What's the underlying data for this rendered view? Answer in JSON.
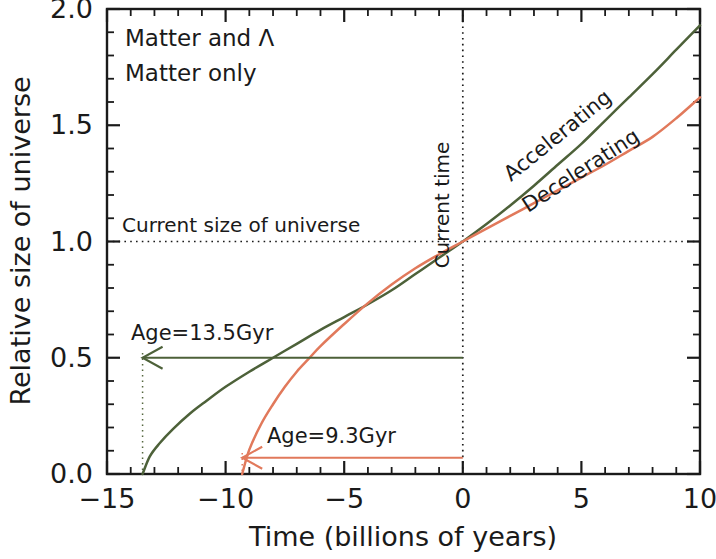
{
  "chart_data": {
    "type": "line",
    "title": "",
    "xlabel": "Time (billions of years)",
    "ylabel": "Relative size of universe",
    "xlim": [
      -15,
      10
    ],
    "ylim": [
      0.0,
      2.0
    ],
    "x_ticks": [
      -15,
      -10,
      -5,
      0,
      5,
      10
    ],
    "x_tick_labels": [
      "-15",
      "-10",
      "-5",
      "0",
      "5",
      "10"
    ],
    "x_minor_step": 1,
    "y_ticks": [
      0.0,
      0.5,
      1.0,
      1.5,
      2.0
    ],
    "y_tick_labels": [
      "0.0",
      "0.5",
      "1.0",
      "1.5",
      "2.0"
    ],
    "y_minor_step": 0.1,
    "grid": false,
    "legend_position": "top-left",
    "series": [
      {
        "name": "Matter and Λ",
        "color": "#4d6139",
        "curve_label": "Accelerating",
        "big_bang_time": -13.5,
        "age_label": "Age=13.5Gyr",
        "x": [
          -13.5,
          -13.2,
          -12.8,
          -12.2,
          -11.5,
          -10.8,
          -10.0,
          -9.0,
          -8.0,
          -7.0,
          -6.0,
          -5.0,
          -4.0,
          -3.0,
          -2.0,
          -1.0,
          0.0,
          1.0,
          2.0,
          3.0,
          4.0,
          5.0,
          6.0,
          7.0,
          8.0,
          9.0,
          10.0
        ],
        "y": [
          0.0,
          0.075,
          0.13,
          0.195,
          0.26,
          0.315,
          0.375,
          0.44,
          0.5,
          0.56,
          0.62,
          0.675,
          0.73,
          0.79,
          0.86,
          0.93,
          1.0,
          1.075,
          1.155,
          1.24,
          1.33,
          1.42,
          1.52,
          1.62,
          1.72,
          1.825,
          1.93
        ]
      },
      {
        "name": "Matter only",
        "color": "#e1795b",
        "curve_label": "Decelerating",
        "big_bang_time": -9.3,
        "age_label": "Age=9.3Gyr",
        "x": [
          -9.3,
          -9.0,
          -8.5,
          -8.0,
          -7.5,
          -7.0,
          -6.5,
          -6.0,
          -5.0,
          -4.0,
          -3.0,
          -2.0,
          -1.0,
          0.0,
          1.0,
          2.0,
          3.0,
          4.0,
          5.0,
          6.0,
          7.0,
          8.0,
          9.0,
          10.0
        ],
        "y": [
          0.0,
          0.105,
          0.215,
          0.3,
          0.375,
          0.44,
          0.495,
          0.55,
          0.645,
          0.735,
          0.815,
          0.885,
          0.945,
          1.0,
          1.055,
          1.11,
          1.165,
          1.22,
          1.275,
          1.33,
          1.39,
          1.45,
          1.53,
          1.62
        ]
      }
    ],
    "annotations": [
      {
        "name": "current-size-line",
        "text": "Current size of universe",
        "type": "hline",
        "value": 1.0
      },
      {
        "name": "current-time-line",
        "text": "Current time",
        "type": "vline",
        "value": 0
      },
      {
        "name": "age-arrow-lcdm",
        "text": "Age=13.5Gyr",
        "from_x": 0,
        "to_x": -13.5,
        "y": 0.5,
        "color": "#4d6139"
      },
      {
        "name": "age-arrow-matter",
        "text": "Age=9.3Gyr",
        "from_x": 0,
        "to_x": -9.3,
        "y": 0.07,
        "color": "#e1795b"
      }
    ]
  },
  "legend": {
    "items": [
      {
        "label": "Matter and Λ",
        "color": "#4d6139"
      },
      {
        "label": "Matter only",
        "color": "#e1795b"
      }
    ]
  },
  "labels": {
    "current_size": "Current size of universe",
    "current_time": "Current time",
    "accelerating": "Accelerating",
    "decelerating": "Decelerating",
    "age_lcdm": "Age=13.5Gyr",
    "age_matter": "Age=9.3Gyr",
    "x_axis_title": "Time (billions of years)",
    "y_axis_title": "Relative size of universe"
  },
  "ticks": {
    "x": [
      "-15",
      "-10",
      "-5",
      "0",
      "5",
      "10"
    ],
    "y": [
      "0.0",
      "0.5",
      "1.0",
      "1.5",
      "2.0"
    ]
  },
  "colors": {
    "green": "#4d6139",
    "coral": "#e1795b",
    "axis": "#1a1a1a"
  }
}
